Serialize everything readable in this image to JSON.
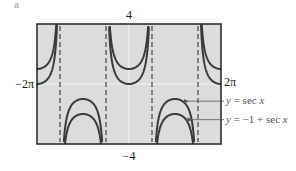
{
  "panel_label": "a",
  "chart_data": {
    "type": "line",
    "title": "",
    "xlabel": "",
    "ylabel": "",
    "xlim": [
      -6.2832,
      6.2832
    ],
    "ylim": [
      -4,
      4
    ],
    "xlim_labels": {
      "min": "−2π",
      "max": "2π"
    },
    "ylim_labels": {
      "max": "4",
      "min": "−4"
    },
    "grid": false,
    "asymptotes_x": [
      -4.7124,
      -1.5708,
      1.5708,
      4.7124
    ],
    "series": [
      {
        "name": "y = sec x",
        "function": "sec(x)",
        "offset": 0
      },
      {
        "name": "y = −1 + sec x",
        "function": "-1 + sec(x)",
        "offset": -1
      }
    ],
    "annotations": [
      {
        "text_prefix": "y = ",
        "text_fn": "sec x",
        "target_series": 0
      },
      {
        "text_prefix": "y = −1 + ",
        "text_fn": "sec x",
        "target_series": 1
      }
    ],
    "colors": {
      "curve": "#3a3a3a",
      "plot_bg": "#dcdcdc",
      "frame": "#222222",
      "axis": "#f4f4f4",
      "asymptote": "#444444",
      "annotation": "#555555"
    }
  }
}
